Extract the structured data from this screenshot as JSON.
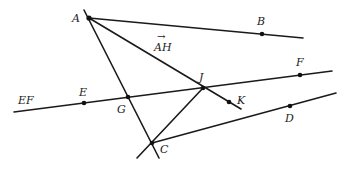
{
  "diagram": {
    "type": "geometry",
    "points": [
      {
        "id": "A",
        "label": "A",
        "x": 89,
        "y": 18,
        "lx": 72,
        "ly": 22,
        "dot": true
      },
      {
        "id": "B",
        "label": "B",
        "x": 262,
        "y": 34,
        "lx": 257,
        "ly": 25,
        "dot": true
      },
      {
        "id": "E",
        "label": "E",
        "x": 84,
        "y": 103,
        "lx": 79,
        "ly": 96,
        "dot": true
      },
      {
        "id": "F",
        "label": "F",
        "x": 300,
        "y": 75,
        "lx": 296,
        "ly": 66,
        "dot": true
      },
      {
        "id": "G",
        "label": "G",
        "x": 128,
        "y": 97,
        "lx": 117,
        "ly": 113,
        "dot": true
      },
      {
        "id": "J",
        "label": "J",
        "x": 203,
        "y": 88,
        "lx": 199,
        "ly": 81,
        "dot": true
      },
      {
        "id": "K",
        "label": "K",
        "x": 229,
        "y": 102,
        "lx": 237,
        "ly": 104,
        "dot": true
      },
      {
        "id": "D",
        "label": "D",
        "x": 290,
        "y": 106,
        "lx": 285,
        "ly": 122,
        "dot": true
      },
      {
        "id": "C",
        "label": "C",
        "x": 152,
        "y": 143,
        "lx": 160,
        "ly": 153,
        "dot": true
      }
    ],
    "labels": {
      "ray_AH": "AH",
      "ray_AH_arrow": "→",
      "line_EF": "EF"
    },
    "segments": [
      {
        "name": "ray-AB",
        "x1": 89,
        "y1": 18,
        "x2": 303,
        "y2": 38
      },
      {
        "name": "line-EF",
        "x1": 14,
        "y1": 112,
        "x2": 332,
        "y2": 71
      },
      {
        "name": "line-AC",
        "x1": 84,
        "y1": 10,
        "x2": 159,
        "y2": 158
      },
      {
        "name": "ray-AH",
        "x1": 89,
        "y1": 18,
        "x2": 241,
        "y2": 109
      },
      {
        "name": "ray-CD",
        "x1": 152,
        "y1": 143,
        "x2": 336,
        "y2": 93
      },
      {
        "name": "line-JC",
        "x1": 203,
        "y1": 88,
        "x2": 137,
        "y2": 158
      }
    ]
  }
}
